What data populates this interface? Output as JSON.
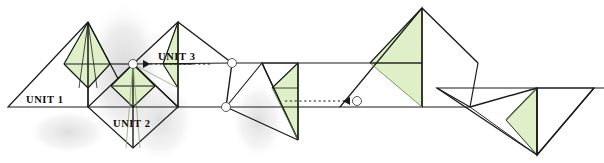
{
  "diagram": {
    "background_color": "#ffffff",
    "line_color": "#1a1a1a",
    "accent_fill": "#dff0c8",
    "accent_stroke": "#8fb36a",
    "shadow_color": "#d8d8d8",
    "labels": [
      {
        "id": "unit-1",
        "text": "UNIT  1",
        "x": 26,
        "y": 103
      },
      {
        "id": "unit-2",
        "text": "UNIT  2",
        "x": 113,
        "y": 127
      },
      {
        "id": "unit-3",
        "text": "UNIT  3",
        "x": 158,
        "y": 60
      }
    ],
    "markers": {
      "circle_radius": 4.5,
      "circles": [
        {
          "id": "joint-marker-a",
          "x": 133,
          "y": 64
        },
        {
          "id": "joint-marker-b",
          "x": 232,
          "y": 63
        },
        {
          "id": "joint-marker-c",
          "x": 226,
          "y": 107
        },
        {
          "id": "joint-marker-d",
          "x": 357,
          "y": 101
        }
      ]
    },
    "arrows": [
      {
        "id": "arrow-left",
        "from_x": 210,
        "to_x": 140,
        "y": 64,
        "direction": "left"
      },
      {
        "id": "arrow-right",
        "from_x": 285,
        "to_x": 352,
        "y": 101,
        "direction": "right"
      }
    ],
    "units": [
      {
        "id": "unit-1",
        "description": "Left large triangle with shaded inner kite"
      },
      {
        "id": "unit-2",
        "description": "Lower diamond with shaded inner kite"
      },
      {
        "id": "unit-3",
        "description": "Upper right triangle with shaded sliver"
      }
    ]
  }
}
